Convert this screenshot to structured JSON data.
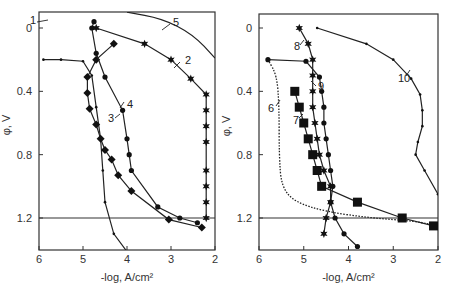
{
  "chart_data": [
    {
      "type": "line",
      "panel": "left",
      "xlabel": "-log, A/cm²",
      "ylabel": "φ, V",
      "xlim": [
        6,
        2
      ],
      "ylim": [
        -0.05,
        1.4
      ],
      "x_ticks": [
        "6",
        "5",
        "4",
        "3",
        "2"
      ],
      "y_ticks": [
        "0",
        "0.4",
        "0.8",
        "1.2"
      ],
      "hline": 1.2,
      "series": [
        {
          "name": "1",
          "marker": "dot-small",
          "points": [
            [
              5.9,
              0.2
            ],
            [
              5.5,
              0.2
            ],
            [
              5.0,
              0.21
            ],
            [
              4.8,
              0.3
            ],
            [
              4.7,
              0.5
            ],
            [
              4.6,
              0.7
            ],
            [
              4.55,
              0.9
            ],
            [
              4.5,
              1.1
            ],
            [
              4.3,
              1.3
            ],
            [
              3.9,
              1.45
            ]
          ]
        },
        {
          "name": "2",
          "marker": "star",
          "points": [
            [
              4.7,
              0.0
            ],
            [
              3.6,
              0.1
            ],
            [
              3.0,
              0.2
            ],
            [
              2.55,
              0.32
            ],
            [
              2.2,
              0.42
            ],
            [
              2.2,
              0.52
            ],
            [
              2.2,
              0.62
            ],
            [
              2.2,
              0.72
            ],
            [
              2.2,
              0.9
            ],
            [
              2.2,
              1.0
            ],
            [
              2.2,
              1.1
            ],
            [
              2.2,
              1.2
            ]
          ]
        },
        {
          "name": "3",
          "marker": "diamond",
          "points": [
            [
              4.3,
              0.1
            ],
            [
              4.7,
              0.2
            ],
            [
              4.9,
              0.31
            ],
            [
              4.9,
              0.41
            ],
            [
              4.85,
              0.51
            ],
            [
              4.7,
              0.61
            ],
            [
              4.6,
              0.7
            ],
            [
              4.5,
              0.77
            ],
            [
              4.35,
              0.83
            ],
            [
              4.2,
              0.93
            ],
            [
              3.9,
              1.03
            ],
            [
              3.05,
              1.21
            ],
            [
              2.3,
              1.26
            ]
          ]
        },
        {
          "name": "4",
          "marker": "dot",
          "points": [
            [
              4.75,
              -0.04
            ],
            [
              4.8,
              0.0
            ],
            [
              4.7,
              0.16
            ],
            [
              4.5,
              0.31
            ],
            [
              4.1,
              0.52
            ],
            [
              4.0,
              0.7
            ],
            [
              3.95,
              0.8
            ],
            [
              3.9,
              0.9
            ],
            [
              3.3,
              1.13
            ],
            [
              2.8,
              1.2
            ],
            [
              2.4,
              1.23
            ]
          ]
        },
        {
          "name": "5",
          "marker": "none",
          "points": [
            [
              4.0,
              -0.1
            ],
            [
              3.2,
              -0.06
            ],
            [
              2.5,
              0.04
            ],
            [
              2.0,
              0.19
            ]
          ]
        }
      ]
    },
    {
      "type": "line",
      "panel": "right",
      "xlabel": "-log, A/cm²",
      "ylabel": "φ, V",
      "xlim": [
        6,
        2
      ],
      "ylim": [
        -0.05,
        1.4
      ],
      "x_ticks": [
        "6",
        "5",
        "4",
        "3",
        "2"
      ],
      "y_ticks": [
        "0",
        "0.4",
        "0.8",
        "1.2"
      ],
      "hline": 1.2,
      "series": [
        {
          "name": "6",
          "marker": "dotted-line",
          "points": [
            [
              5.8,
              0.2
            ],
            [
              5.6,
              0.3
            ],
            [
              5.55,
              0.5
            ],
            [
              5.55,
              0.8
            ],
            [
              5.5,
              1.0
            ],
            [
              5.2,
              1.1
            ],
            [
              4.5,
              1.16
            ],
            [
              3.5,
              1.2
            ],
            [
              2.5,
              1.22
            ],
            [
              2.0,
              1.25
            ]
          ]
        },
        {
          "name": "7",
          "marker": "square",
          "points": [
            [
              5.2,
              0.4
            ],
            [
              5.1,
              0.5
            ],
            [
              5.0,
              0.6
            ],
            [
              4.9,
              0.7
            ],
            [
              4.8,
              0.8
            ],
            [
              4.7,
              0.9
            ],
            [
              4.6,
              1.0
            ],
            [
              3.8,
              1.1
            ],
            [
              2.8,
              1.2
            ],
            [
              2.1,
              1.25
            ]
          ]
        },
        {
          "name": "8",
          "marker": "star",
          "points": [
            [
              5.1,
              0.0
            ],
            [
              4.9,
              0.1
            ],
            [
              4.8,
              0.2
            ],
            [
              4.8,
              0.3
            ],
            [
              4.8,
              0.4
            ],
            [
              4.8,
              0.5
            ],
            [
              4.75,
              0.6
            ],
            [
              4.7,
              0.7
            ],
            [
              4.65,
              0.8
            ],
            [
              4.55,
              0.9
            ],
            [
              4.4,
              1.0
            ],
            [
              4.4,
              1.1
            ],
            [
              4.5,
              1.2
            ],
            [
              4.55,
              1.3
            ]
          ]
        },
        {
          "name": "9",
          "marker": "dot",
          "points": [
            [
              5.8,
              0.2
            ],
            [
              4.95,
              0.21
            ],
            [
              4.65,
              0.31
            ],
            [
              4.6,
              0.4
            ],
            [
              4.55,
              0.5
            ],
            [
              4.55,
              0.6
            ],
            [
              4.5,
              0.7
            ],
            [
              4.45,
              0.8
            ],
            [
              4.4,
              0.9
            ],
            [
              4.35,
              1.0
            ],
            [
              4.4,
              1.1
            ],
            [
              4.3,
              1.2
            ],
            [
              4.1,
              1.3
            ],
            [
              3.8,
              1.38
            ]
          ]
        },
        {
          "name": "10",
          "marker": "dot-small",
          "points": [
            [
              4.7,
              0.0
            ],
            [
              3.6,
              0.1
            ],
            [
              3.0,
              0.2
            ],
            [
              2.6,
              0.32
            ],
            [
              2.4,
              0.42
            ],
            [
              2.35,
              0.52
            ],
            [
              2.35,
              0.62
            ],
            [
              2.45,
              0.72
            ],
            [
              2.5,
              0.8
            ],
            [
              2.3,
              0.9
            ],
            [
              2.0,
              1.05
            ]
          ]
        }
      ]
    }
  ],
  "labels": {
    "xlabel": "-log, A/cm²",
    "ylabel": "φ, V"
  }
}
